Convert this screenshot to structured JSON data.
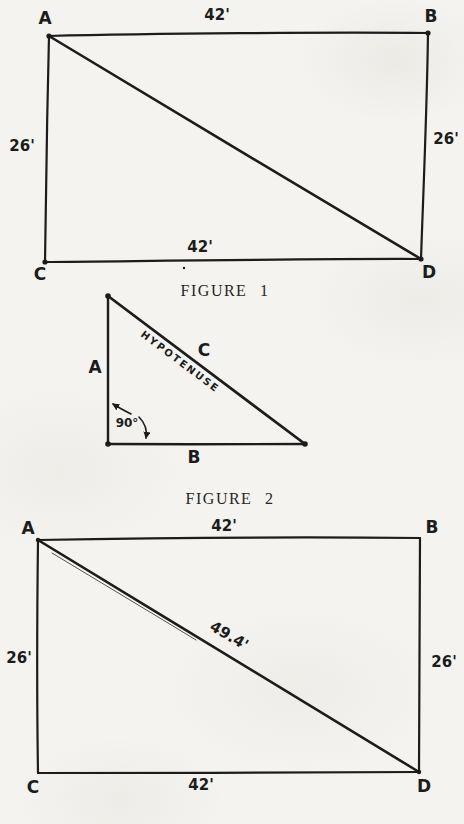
{
  "page": {
    "background": "#f4f3ef",
    "ink": "#1c1c1c"
  },
  "figure1": {
    "caption": "FIGURE 1",
    "corners": {
      "top_left": "A",
      "top_right": "B",
      "bottom_left": "C",
      "bottom_right": "D"
    },
    "sides": {
      "top": "42'",
      "bottom": "42'",
      "left": "26'",
      "right": "26'"
    }
  },
  "figure2": {
    "caption": "FIGURE 2",
    "labels": {
      "vertical_side": "A",
      "horizontal_side": "B",
      "hypotenuse_side": "C",
      "hypotenuse_word": "HYPOTENUSE",
      "right_angle": "90°"
    }
  },
  "figure3": {
    "corners": {
      "top_left": "A",
      "top_right": "B",
      "bottom_left": "C",
      "bottom_right": "D"
    },
    "sides": {
      "top": "42'",
      "bottom": "42'",
      "left": "26'",
      "right": "26'"
    },
    "diagonal": "49.4'"
  }
}
